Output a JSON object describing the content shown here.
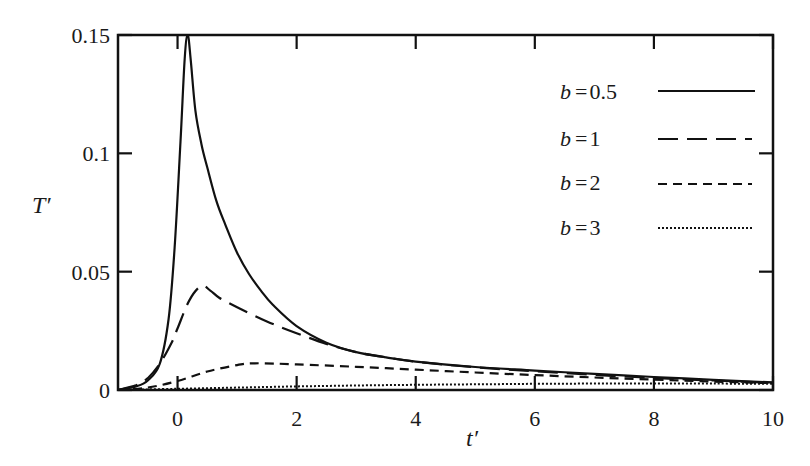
{
  "chart_data": {
    "type": "line",
    "title": "",
    "xlabel": "t′",
    "ylabel": "T′",
    "xlim": [
      -1,
      10
    ],
    "ylim": [
      0,
      0.15
    ],
    "xticks": [
      0,
      2,
      4,
      6,
      8,
      10
    ],
    "xtick_labels": [
      "0",
      "2",
      "4",
      "6",
      "8",
      "10"
    ],
    "yticks": [
      0,
      0.05,
      0.1,
      0.15
    ],
    "ytick_labels": [
      "0",
      "0.05",
      "0.1",
      "0.15"
    ],
    "grid": false,
    "legend_position": "upper right",
    "series": [
      {
        "name": "b = 0.5",
        "style": "solid",
        "x": [
          -1,
          -0.7,
          -0.5,
          -0.3,
          -0.15,
          -0.05,
          0.05,
          0.12,
          0.17,
          0.22,
          0.3,
          0.4,
          0.5,
          0.65,
          0.8,
          1.0,
          1.2,
          1.4,
          1.6,
          2.0,
          2.5,
          3.0,
          3.5,
          4,
          5,
          6,
          7,
          8,
          9,
          10
        ],
        "y": [
          0,
          0.0015,
          0.004,
          0.011,
          0.03,
          0.06,
          0.105,
          0.14,
          0.15,
          0.14,
          0.118,
          0.104,
          0.094,
          0.08,
          0.07,
          0.058,
          0.049,
          0.042,
          0.036,
          0.027,
          0.02,
          0.016,
          0.0138,
          0.012,
          0.0097,
          0.0082,
          0.0068,
          0.0055,
          0.0043,
          0.0032
        ]
      },
      {
        "name": "b = 1",
        "style": "long-dash",
        "x": [
          -1,
          -0.7,
          -0.5,
          -0.3,
          -0.1,
          0.0,
          0.2,
          0.4,
          0.55,
          0.7,
          1.0,
          1.5,
          2.0,
          2.5,
          3.0,
          3.5,
          4,
          5,
          6,
          7,
          8,
          9,
          10
        ],
        "y": [
          0,
          0.002,
          0.005,
          0.011,
          0.02,
          0.026,
          0.038,
          0.044,
          0.042,
          0.039,
          0.035,
          0.029,
          0.024,
          0.0195,
          0.016,
          0.0138,
          0.012,
          0.0096,
          0.0079,
          0.0064,
          0.0051,
          0.004,
          0.003
        ]
      },
      {
        "name": "b = 2",
        "style": "short-dash",
        "x": [
          -1,
          -0.5,
          0,
          0.5,
          1.0,
          1.3,
          2.0,
          3.0,
          4,
          5,
          6,
          7,
          8,
          9,
          10
        ],
        "y": [
          0,
          0.001,
          0.0038,
          0.0078,
          0.0105,
          0.0113,
          0.0108,
          0.0098,
          0.0086,
          0.0074,
          0.0063,
          0.0053,
          0.0044,
          0.0036,
          0.0029
        ]
      },
      {
        "name": "b = 3",
        "style": "dotted",
        "x": [
          -1,
          0,
          1,
          2,
          3,
          4,
          5,
          6,
          7,
          8,
          9,
          10
        ],
        "y": [
          0,
          0.0005,
          0.001,
          0.0015,
          0.0019,
          0.0022,
          0.0024,
          0.0026,
          0.0027,
          0.0027,
          0.0027,
          0.0026
        ]
      }
    ]
  },
  "legend": {
    "items": [
      {
        "label": "b = 0.5",
        "var": "b",
        "value": "0.5"
      },
      {
        "label": "b = 1",
        "var": "b",
        "value": "1"
      },
      {
        "label": "b = 2",
        "var": "b",
        "value": "2"
      },
      {
        "label": "b = 3",
        "var": "b",
        "value": "3"
      }
    ]
  },
  "axes": {
    "x_label": "t′",
    "y_label": "T′"
  },
  "colors": {
    "line": "#111111",
    "axis": "#111111",
    "background": "#ffffff"
  }
}
